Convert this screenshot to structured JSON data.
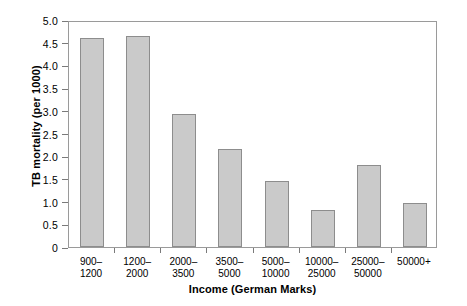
{
  "chart_data": {
    "type": "bar",
    "title": "",
    "xlabel": "Income (German Marks)",
    "ylabel": "TB mortality (per 1000)",
    "categories": [
      "900–1200",
      "1200–2000",
      "2000–3500",
      "3500–5000",
      "5000–10000",
      "10000–25000",
      "25000–50000",
      "50000+"
    ],
    "category_lines": [
      [
        "900–",
        "1200"
      ],
      [
        "1200–",
        "2000"
      ],
      [
        "2000–",
        "3500"
      ],
      [
        "3500–",
        "5000"
      ],
      [
        "5000–",
        "10000"
      ],
      [
        "10000–",
        "25000"
      ],
      [
        "25000–",
        "50000"
      ],
      [
        "50000+",
        ""
      ]
    ],
    "values": [
      4.6,
      4.65,
      2.93,
      2.16,
      1.45,
      0.82,
      1.81,
      0.98
    ],
    "ylim": [
      0,
      5.0
    ],
    "ytick_values": [
      0,
      0.5,
      1.0,
      1.5,
      2.0,
      2.5,
      3.0,
      3.5,
      4.0,
      4.5,
      5.0
    ],
    "ytick_labels": [
      "0",
      "0.5",
      "1.0",
      "1.5",
      "2.0",
      "2.5",
      "3.0",
      "3.5",
      "4.0",
      "4.5",
      "5.0"
    ],
    "grid": false,
    "legend": null,
    "bar_color": "#cacaca",
    "bar_edge_color": "#8d8d8d",
    "axis_color": "#9a9a9a",
    "background_color": "#ffffff"
  }
}
